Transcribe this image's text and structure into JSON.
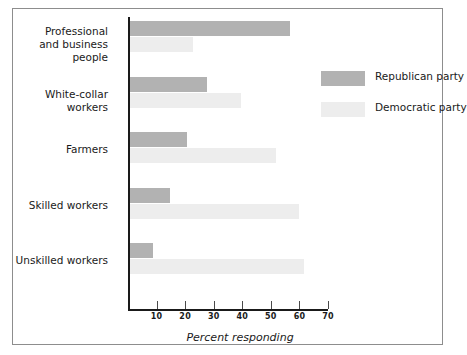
{
  "chart_data": {
    "type": "bar",
    "orientation": "horizontal",
    "title": "",
    "xlabel": "Percent responding",
    "ylabel": "",
    "xlim": [
      0,
      70
    ],
    "xticks": [
      10,
      20,
      30,
      40,
      50,
      60,
      70
    ],
    "grid": false,
    "legend_position": "upper right",
    "categories": [
      "Professional\nand business people",
      "White-collar workers",
      "Farmers",
      "Skilled workers",
      "Unskilled workers"
    ],
    "series": [
      {
        "name": "Republican party",
        "color": "#b2b2b2",
        "values": [
          56,
          27,
          20,
          14,
          8
        ]
      },
      {
        "name": "Democratic party",
        "color": "#ededed",
        "values": [
          22,
          39,
          51,
          59,
          61
        ]
      }
    ]
  },
  "axis": {
    "xlabel": "Percent responding",
    "tick_labels": [
      "10",
      "20",
      "30",
      "40",
      "50",
      "60",
      "70"
    ]
  },
  "legend": {
    "entries": [
      {
        "label": "Republican party",
        "swatch": "republican-swatch"
      },
      {
        "label": "Democratic party",
        "swatch": "democratic-swatch"
      }
    ]
  },
  "categories": [
    {
      "label": "Professional\nand business people"
    },
    {
      "label": "White-collar workers"
    },
    {
      "label": "Farmers"
    },
    {
      "label": "Skilled workers"
    },
    {
      "label": "Unskilled workers"
    }
  ]
}
